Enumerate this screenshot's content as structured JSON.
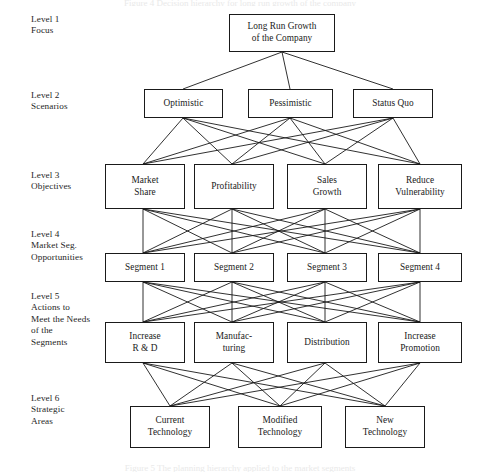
{
  "diagram": {
    "title": "Decision hierarchy for long run growth of the company",
    "edge_color": "#1a1a1a",
    "box_border_color": "#1a1a1a",
    "background_color": "#ffffff",
    "levels": [
      {
        "id": "level-1",
        "label": "Level 1\nFocus",
        "label_x": 31,
        "label_y": 14,
        "nodes": [
          {
            "id": "long-run-growth",
            "text": "Long Run Growth\nof the Company",
            "x": 229,
            "y": 14,
            "w": 106,
            "h": 38
          }
        ]
      },
      {
        "id": "level-2",
        "label": "Level 2\nScenarios",
        "label_x": 31,
        "label_y": 90,
        "nodes": [
          {
            "id": "optimistic",
            "text": "Optimistic",
            "x": 144,
            "y": 89,
            "w": 79,
            "h": 29
          },
          {
            "id": "pessimistic",
            "text": "Pessimistic",
            "x": 248,
            "y": 89,
            "w": 85,
            "h": 29
          },
          {
            "id": "status-quo",
            "text": "Status Quo",
            "x": 353,
            "y": 89,
            "w": 80,
            "h": 29
          }
        ]
      },
      {
        "id": "level-3",
        "label": "Level 3\nObjectives",
        "label_x": 31,
        "label_y": 170,
        "nodes": [
          {
            "id": "market-share",
            "text": "Market\nShare",
            "x": 105,
            "y": 164,
            "w": 80,
            "h": 45
          },
          {
            "id": "profitability",
            "text": "Profitability",
            "x": 194,
            "y": 164,
            "w": 80,
            "h": 45
          },
          {
            "id": "sales-growth",
            "text": "Sales\nGrowth",
            "x": 287,
            "y": 164,
            "w": 80,
            "h": 45
          },
          {
            "id": "reduce-vulnerability",
            "text": "Reduce\nVulnerability",
            "x": 378,
            "y": 164,
            "w": 84,
            "h": 45
          }
        ]
      },
      {
        "id": "level-4",
        "label": "Level 4\nMarket Seg.\nOpportunities",
        "label_x": 31,
        "label_y": 229,
        "nodes": [
          {
            "id": "segment-1",
            "text": "Segment 1",
            "x": 105,
            "y": 253,
            "w": 80,
            "h": 29
          },
          {
            "id": "segment-2",
            "text": "Segment 2",
            "x": 194,
            "y": 253,
            "w": 80,
            "h": 29
          },
          {
            "id": "segment-3",
            "text": "Segment 3",
            "x": 287,
            "y": 253,
            "w": 80,
            "h": 29
          },
          {
            "id": "segment-4",
            "text": "Segment 4",
            "x": 378,
            "y": 253,
            "w": 84,
            "h": 29
          }
        ]
      },
      {
        "id": "level-5",
        "label": "Level 5\nActions to\nMeet the Needs\nof the\nSegments",
        "label_x": 31,
        "label_y": 291,
        "nodes": [
          {
            "id": "increase-rd",
            "text": "Increase\nR & D",
            "x": 105,
            "y": 322,
            "w": 80,
            "h": 41
          },
          {
            "id": "manufacturing",
            "text": "Manufac-\nturing",
            "x": 194,
            "y": 322,
            "w": 80,
            "h": 41
          },
          {
            "id": "distribution",
            "text": "Distribution",
            "x": 287,
            "y": 322,
            "w": 80,
            "h": 41
          },
          {
            "id": "increase-promotion",
            "text": "Increase\nPromotion",
            "x": 378,
            "y": 322,
            "w": 84,
            "h": 41
          }
        ]
      },
      {
        "id": "level-6",
        "label": "Level 6\nStrategic\nAreas",
        "label_x": 31,
        "label_y": 393,
        "nodes": [
          {
            "id": "current-technology",
            "text": "Current\nTechnology",
            "x": 130,
            "y": 406,
            "w": 80,
            "h": 42
          },
          {
            "id": "modified-technology",
            "text": "Modified\nTechnology",
            "x": 238,
            "y": 406,
            "w": 84,
            "h": 42
          },
          {
            "id": "new-technology",
            "text": "New\nTechnology",
            "x": 345,
            "y": 406,
            "w": 80,
            "h": 42
          }
        ]
      }
    ],
    "edge_groups": [
      {
        "id": "edges-1-2",
        "from_points": [
          [
            282,
            52
          ]
        ],
        "to_points": [
          [
            183,
            89
          ],
          [
            290,
            89
          ],
          [
            393,
            89
          ]
        ]
      },
      {
        "id": "edges-2-3",
        "from_points": [
          [
            183,
            118
          ],
          [
            290,
            118
          ],
          [
            393,
            118
          ]
        ],
        "to_points": [
          [
            143,
            164
          ],
          [
            232,
            164
          ],
          [
            325,
            164
          ],
          [
            420,
            164
          ]
        ]
      },
      {
        "id": "edges-3-4",
        "from_points": [
          [
            143,
            209
          ],
          [
            232,
            209
          ],
          [
            325,
            209
          ],
          [
            420,
            209
          ]
        ],
        "to_points": [
          [
            143,
            253
          ],
          [
            232,
            253
          ],
          [
            325,
            253
          ],
          [
            420,
            253
          ]
        ]
      },
      {
        "id": "edges-4-5",
        "from_points": [
          [
            143,
            282
          ],
          [
            232,
            282
          ],
          [
            325,
            282
          ],
          [
            420,
            282
          ]
        ],
        "to_points": [
          [
            143,
            322
          ],
          [
            232,
            322
          ],
          [
            325,
            322
          ],
          [
            420,
            322
          ]
        ]
      },
      {
        "id": "edges-5-6",
        "from_points": [
          [
            143,
            363
          ],
          [
            232,
            363
          ],
          [
            325,
            363
          ],
          [
            420,
            363
          ]
        ],
        "to_points": [
          [
            170,
            406
          ],
          [
            280,
            406
          ],
          [
            385,
            406
          ]
        ]
      }
    ]
  },
  "captions": {
    "top": "Figure 4 Decision hierarchy for long run growth of the company",
    "bottom": "Figure 5 The planning hierarchy applied to the market segments"
  }
}
